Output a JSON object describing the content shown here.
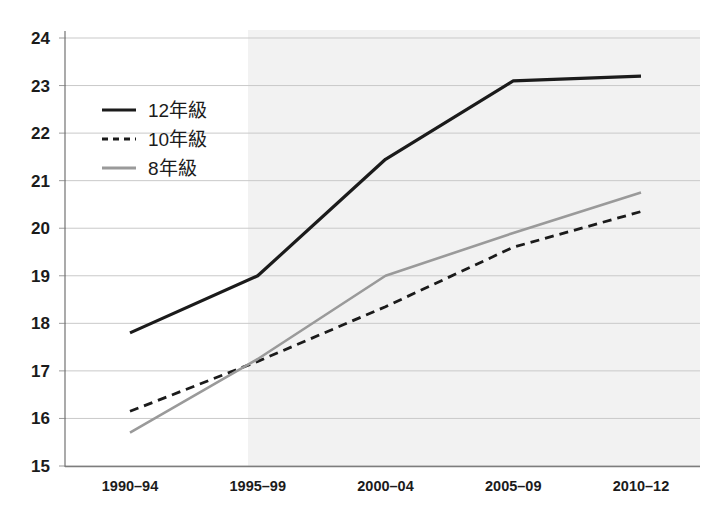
{
  "chart_data": {
    "type": "line",
    "title": "",
    "subtitle": "",
    "xlabel": "",
    "ylabel": "",
    "categories": [
      "1990–94",
      "1995–99",
      "2000–04",
      "2005–09",
      "2010–12"
    ],
    "ylim": [
      15,
      24
    ],
    "xlim": [
      0,
      4
    ],
    "yticks": [
      15,
      16,
      17,
      18,
      19,
      20,
      21,
      22,
      23,
      24
    ],
    "ytick_labels": [
      "15",
      "16",
      "17",
      "18",
      "19",
      "20",
      "21",
      "22",
      "23",
      "24"
    ],
    "grid": "horizontal",
    "legend_position": "upper-left-inside",
    "shaded_region": {
      "from_category": "1995–99",
      "to_category": "2010–12",
      "color": "#f2f2f2"
    },
    "series": [
      {
        "name": "12年級",
        "style": "solid",
        "color": "#1b1b1b",
        "width": 3.2,
        "values": [
          17.8,
          19.0,
          21.45,
          23.1,
          23.2
        ]
      },
      {
        "name": "10年級",
        "style": "dashed",
        "color": "#1b1b1b",
        "width": 2.8,
        "values": [
          16.15,
          17.2,
          18.35,
          19.6,
          20.35
        ]
      },
      {
        "name": "8年級",
        "style": "solid",
        "color": "#9a9a9a",
        "width": 2.6,
        "values": [
          15.7,
          17.25,
          19.0,
          19.9,
          20.75
        ]
      }
    ],
    "legend_entries": [
      {
        "label": "12年級",
        "style": "solid",
        "color": "#1b1b1b"
      },
      {
        "label": "10年級",
        "style": "dashed",
        "color": "#1b1b1b"
      },
      {
        "label": "8年級",
        "style": "solid",
        "color": "#9a9a9a"
      }
    ]
  },
  "colors": {
    "grade12": "#1b1b1b",
    "grade10": "#1b1b1b",
    "grade8": "#9a9a9a",
    "gridline": "#c9c9c9",
    "axis": "#7d7d7d",
    "band": "#f2f2f2",
    "background": "#ffffff"
  }
}
